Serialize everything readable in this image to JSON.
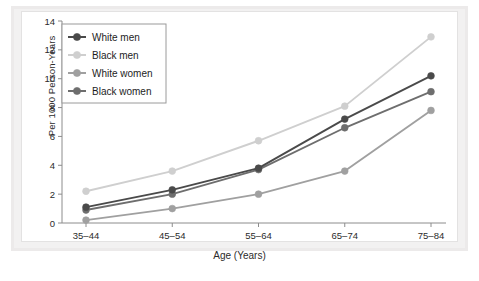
{
  "chart_data": {
    "type": "line",
    "title": "",
    "xlabel": "Age (Years)",
    "ylabel": "Per 1000 Person-Years",
    "categories": [
      "35–44",
      "45–54",
      "55–64",
      "65–74",
      "75–84"
    ],
    "ylim": [
      0,
      14
    ],
    "yticks": [
      0,
      2,
      4,
      6,
      8,
      10,
      12,
      14
    ],
    "grid": false,
    "legend_position": "top-left",
    "series": [
      {
        "name": "White men",
        "values": [
          1.1,
          2.3,
          3.8,
          7.2,
          10.2
        ],
        "color": "#4a4a4a"
      },
      {
        "name": "Black men",
        "values": [
          2.2,
          3.6,
          5.7,
          8.1,
          12.9
        ],
        "color": "#cfcfcf"
      },
      {
        "name": "White women",
        "values": [
          0.2,
          1.0,
          2.0,
          3.6,
          7.8
        ],
        "color": "#a0a0a0"
      },
      {
        "name": "Black women",
        "values": [
          0.9,
          2.0,
          3.7,
          6.6,
          9.1
        ],
        "color": "#6e6e6e"
      }
    ]
  },
  "axis": {
    "y_tick_labels": [
      "0",
      "2",
      "4",
      "6",
      "8",
      "10",
      "12",
      "14"
    ],
    "x_tick_labels": [
      "35–44",
      "45–54",
      "55–64",
      "65–74",
      "75–84"
    ],
    "y_title": "Per 1000 Person-Years",
    "x_title": "Age (Years)"
  },
  "legend": {
    "items": [
      {
        "label": "White men"
      },
      {
        "label": "Black men"
      },
      {
        "label": "White women"
      },
      {
        "label": "Black women"
      }
    ]
  },
  "caption": {
    "partial_line": " "
  }
}
